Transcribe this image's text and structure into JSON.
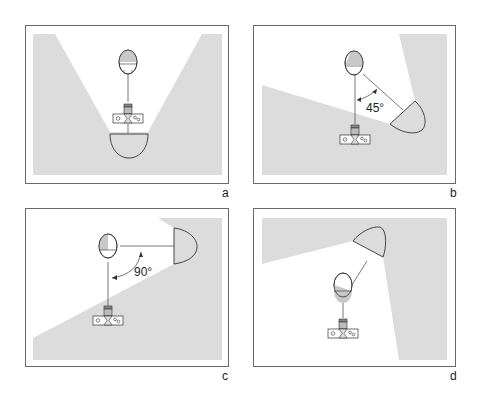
{
  "figure": {
    "panels": [
      {
        "id": "a",
        "label": "a",
        "angle_label": ""
      },
      {
        "id": "b",
        "label": "b",
        "angle_label": "45°"
      },
      {
        "id": "c",
        "label": "c",
        "angle_label": "90°"
      },
      {
        "id": "d",
        "label": "d",
        "angle_label": ""
      }
    ],
    "colors": {
      "shade": "#dcdcdc",
      "frame": "#6a6a6a",
      "ink": "#333333"
    }
  }
}
